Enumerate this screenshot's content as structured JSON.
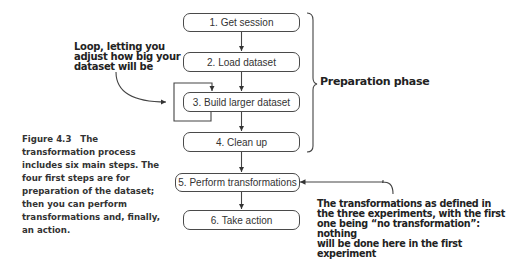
{
  "steps": [
    {
      "label": "1. Get session"
    },
    {
      "label": "2. Load dataset"
    },
    {
      "label": "3. Build larger dataset"
    },
    {
      "label": "4. Clean up"
    },
    {
      "label": "5. Perform transformations"
    },
    {
      "label": "6. Take action"
    }
  ],
  "annotations": {
    "loop": [
      "Loop, letting you",
      "adjust how big your",
      "dataset will be"
    ],
    "phase": "Preparation phase",
    "transformations": [
      "The transformations as defined in",
      "the three experiments, with the first",
      "one being “no transformation”: nothing",
      "will be done here in the first experiment"
    ]
  },
  "caption": {
    "figure_number": "Figure 4.3",
    "text": "The transformation process includes six main steps. The four first steps are for preparation of the dataset; then you can perform transformations and, finally, an action."
  }
}
